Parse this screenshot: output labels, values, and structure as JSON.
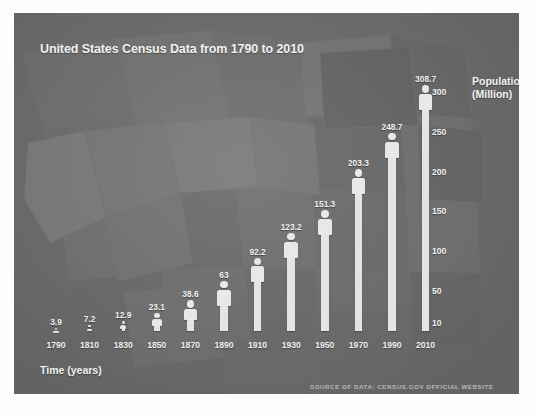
{
  "poster": {
    "title": "United States Census Data from 1790 to 2010",
    "x_axis_title": "Time (years)",
    "y_axis_title_line1": "Population",
    "y_axis_title_line2": "(Million)",
    "source_note": "Source of Data: Census.gov official website",
    "panel_color": "#6e6e6e",
    "bar_color": "#e8e8e8",
    "text_color": "#f0f0f0"
  },
  "chart_data": {
    "type": "bar",
    "title": "United States Census Data from 1790 to 2010",
    "xlabel": "Time (years)",
    "ylabel": "Population (Million)",
    "categories": [
      "1790",
      "1810",
      "1830",
      "1850",
      "1870",
      "1890",
      "1910",
      "1930",
      "1950",
      "1970",
      "1990",
      "2010"
    ],
    "values": [
      3.9,
      7.2,
      12.9,
      23.1,
      38.6,
      63,
      92.2,
      123.2,
      151.3,
      203.3,
      248.7,
      308.7
    ],
    "value_labels": [
      "3.9",
      "7.2",
      "12.9",
      "23.1",
      "38.6",
      "63",
      "92.2",
      "123.2",
      "151.3",
      "203.3",
      "248.7",
      "308.7"
    ],
    "ylim": [
      0,
      320
    ],
    "ytick_labels": [
      "300",
      "250",
      "200",
      "150",
      "100",
      "50",
      "10"
    ],
    "ytick_values": [
      300,
      250,
      200,
      150,
      100,
      50,
      10
    ],
    "grid": false,
    "legend": "none",
    "marker_style": "person-pictogram",
    "annotation": "Source of Data: Census.gov official website",
    "background": "faint grayscale US state map"
  }
}
